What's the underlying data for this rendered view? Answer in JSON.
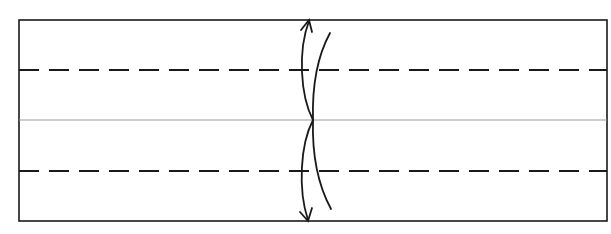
{
  "diagram": {
    "type": "paper-folding",
    "colors": {
      "background": "#ffffff",
      "stroke": "#1a1a1a",
      "center_line": "#9a9a9a"
    },
    "paper": {
      "x": 19,
      "y": 20,
      "width": 588,
      "height": 201
    },
    "center_line_y": 120,
    "fold_lines": [
      {
        "kind": "valley-dashed",
        "y": 70
      },
      {
        "kind": "valley-dashed",
        "y": 171
      }
    ],
    "fold_arrows": [
      {
        "direction": "up",
        "tip": [
          309,
          20
        ],
        "start": [
          313,
          120
        ]
      },
      {
        "direction": "down",
        "tip": [
          308,
          221
        ],
        "start": [
          313,
          120
        ]
      }
    ]
  }
}
